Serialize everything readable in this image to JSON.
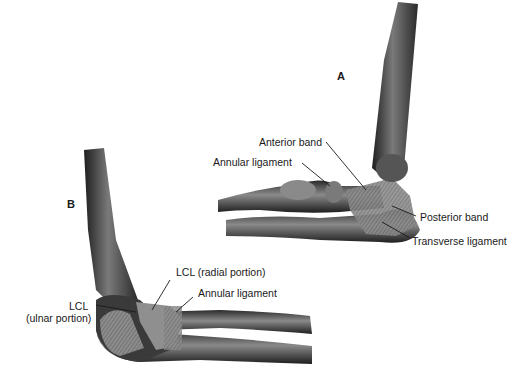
{
  "figure": {
    "panels": [
      {
        "id": "A",
        "label": "A",
        "annotations": [
          {
            "text": "Anterior band"
          },
          {
            "text": "Annular ligament"
          },
          {
            "text": "Posterior band"
          },
          {
            "text": "Transverse ligament"
          }
        ]
      },
      {
        "id": "B",
        "label": "B",
        "annotations": [
          {
            "text": "LCL (radial portion)"
          },
          {
            "text": "Annular ligament"
          },
          {
            "text": "LCL"
          },
          {
            "text": "(ulnar portion)"
          }
        ]
      }
    ]
  },
  "colors": {
    "bone_dark": "#2a2a2a",
    "bone_mid": "#6b6b6b",
    "ligament": "#9a9a9a",
    "leader_line": "#1a1a1a",
    "background": "#ffffff"
  }
}
